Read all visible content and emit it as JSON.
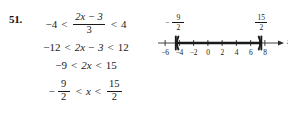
{
  "problem": {
    "number": "51.",
    "steps": [
      {
        "id": "step-1",
        "left": "−4",
        "rel1": "<",
        "middle_type": "fraction",
        "middle_numerator": "2x − 3",
        "middle_denominator": "3",
        "rel2": "<",
        "right": "4"
      },
      {
        "id": "step-2",
        "left": "−12",
        "rel1": "<",
        "middle_type": "text",
        "middle": "2x − 3",
        "rel2": "<",
        "right": "12"
      },
      {
        "id": "step-3",
        "left": "−9",
        "rel1": "<",
        "middle_type": "text",
        "middle": "2x",
        "rel2": "<",
        "right": "15"
      },
      {
        "id": "step-4",
        "left_type": "neg-fraction",
        "left_sign": "−",
        "left_numerator": "9",
        "left_denominator": "2",
        "rel1": "<",
        "middle_type": "text",
        "middle": "x",
        "rel2": "<",
        "right_type": "fraction",
        "right_numerator": "15",
        "right_denominator": "2"
      }
    ]
  },
  "chart_data": {
    "type": "numberline",
    "title": "",
    "xlabel": "x",
    "axis_variable": "x",
    "xlim": [
      -7,
      9
    ],
    "ticks": [
      -6,
      -4,
      -2,
      0,
      2,
      4,
      6,
      8
    ],
    "tick_labels": [
      "−6",
      "−4",
      "−2",
      "0",
      "2",
      "4",
      "6",
      "8"
    ],
    "interval": {
      "lower": -4.5,
      "upper": 7.5,
      "lower_label_numerator": "9",
      "lower_label_denominator": "2",
      "lower_label_sign": "−",
      "upper_label_numerator": "15",
      "upper_label_denominator": "2",
      "lower_endpoint_style": "open-bracket-paren",
      "upper_endpoint_style": "open-bracket-paren",
      "shaded": true
    },
    "grid": false,
    "legend": "none",
    "colors": {
      "axis": "#2a2a2a",
      "interval": "#1a1a1a",
      "text": "#1a1a1a",
      "background": "#ffffff"
    }
  }
}
